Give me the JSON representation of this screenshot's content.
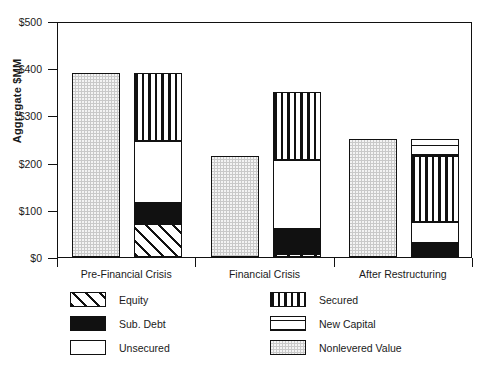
{
  "chart_data": {
    "type": "bar",
    "title": "",
    "xlabel": "",
    "ylabel": "Aggregate  $MM",
    "ylim": [
      0,
      500
    ],
    "ytick_labels": [
      "$0",
      "$100",
      "$200",
      "$300",
      "$400",
      "$500"
    ],
    "ytick_values": [
      0,
      100,
      200,
      300,
      400,
      500
    ],
    "grid": false,
    "legend_position": "below-plot",
    "categories": [
      "Pre-Financial Crisis",
      "Financial Crisis",
      "After Restructuring"
    ],
    "groups": [
      {
        "category": "Pre-Financial Crisis",
        "bars": [
          {
            "name": "nonlevered-value-bar",
            "total": 390,
            "segments": [
              {
                "name": "Nonlevered Value",
                "value": 390,
                "pattern": "p-nonlev"
              }
            ]
          },
          {
            "name": "capital-structure-bar",
            "total": 390,
            "segments": [
              {
                "name": "Equity",
                "value": 70,
                "pattern": "p-equity"
              },
              {
                "name": "Sub. Debt",
                "value": 45,
                "pattern": "p-subdebt"
              },
              {
                "name": "Unsecured",
                "value": 130,
                "pattern": "p-unsec"
              },
              {
                "name": "Secured",
                "value": 145,
                "pattern": "p-secured"
              }
            ]
          }
        ]
      },
      {
        "category": "Financial Crisis",
        "bars": [
          {
            "name": "nonlevered-value-bar",
            "total": 215,
            "segments": [
              {
                "name": "Nonlevered Value",
                "value": 215,
                "pattern": "p-nonlev"
              }
            ]
          },
          {
            "name": "capital-structure-bar",
            "total": 350,
            "segments": [
              {
                "name": "Equity",
                "value": 6,
                "pattern": "p-equity"
              },
              {
                "name": "Sub. Debt",
                "value": 54,
                "pattern": "p-subdebt"
              },
              {
                "name": "Unsecured",
                "value": 145,
                "pattern": "p-unsec"
              },
              {
                "name": "Secured",
                "value": 145,
                "pattern": "p-secured"
              }
            ]
          }
        ]
      },
      {
        "category": "After Restructuring",
        "bars": [
          {
            "name": "nonlevered-value-bar",
            "total": 250,
            "segments": [
              {
                "name": "Nonlevered Value",
                "value": 250,
                "pattern": "p-nonlev"
              }
            ]
          },
          {
            "name": "capital-structure-bar",
            "total": 250,
            "segments": [
              {
                "name": "Equity",
                "value": 4,
                "pattern": "p-equity"
              },
              {
                "name": "Sub. Debt",
                "value": 26,
                "pattern": "p-subdebt"
              },
              {
                "name": "Unsecured",
                "value": 45,
                "pattern": "p-unsec"
              },
              {
                "name": "Secured",
                "value": 140,
                "pattern": "p-secured"
              },
              {
                "name": "New Capital",
                "value": 35,
                "pattern": "p-newcap"
              }
            ]
          }
        ]
      }
    ],
    "legend": [
      {
        "label": "Equity",
        "pattern": "p-equity",
        "column": 0,
        "row": 0
      },
      {
        "label": "Sub. Debt",
        "pattern": "p-subdebt",
        "column": 0,
        "row": 1
      },
      {
        "label": "Unsecured",
        "pattern": "p-unsec",
        "column": 0,
        "row": 2
      },
      {
        "label": "Secured",
        "pattern": "p-secured",
        "column": 1,
        "row": 0
      },
      {
        "label": "New  Capital",
        "pattern": "p-newcap",
        "column": 1,
        "row": 1
      },
      {
        "label": "Nonlevered  Value",
        "pattern": "p-nonlev",
        "column": 1,
        "row": 2
      }
    ],
    "colors": {
      "axis": "#111111",
      "nonlevered": "#c9c9c9",
      "sub_debt": "#111111",
      "unsecured": "#ffffff",
      "background": "#ffffff"
    }
  }
}
